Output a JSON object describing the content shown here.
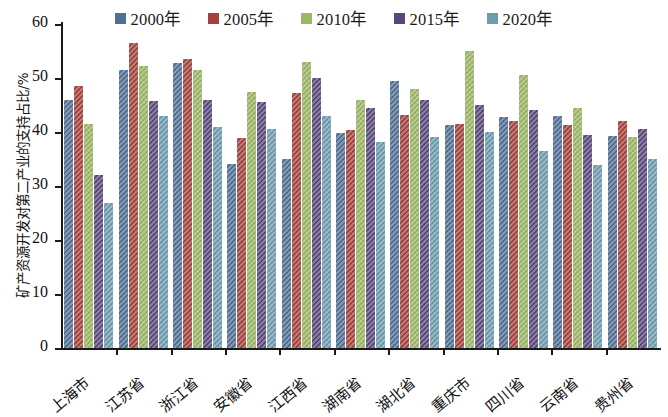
{
  "chart": {
    "type": "bar",
    "title": "",
    "ylabel": "矿产资源开发对第二产业的支持占比/%",
    "xlabel": ""
  },
  "legend": {
    "position": "top-center",
    "items": [
      {
        "label": "2000年",
        "color": "#4f6f96"
      },
      {
        "label": "2005年",
        "color": "#a5413a"
      },
      {
        "label": "2010年",
        "color": "#9cb863"
      },
      {
        "label": "2015年",
        "color": "#58477a"
      },
      {
        "label": "2020年",
        "color": "#6d9cb0"
      }
    ]
  },
  "axes": {
    "y_ticks": [
      "60",
      "50",
      "40",
      "30",
      "20",
      "10",
      "0"
    ],
    "y_min": 0,
    "y_max": 60,
    "y_step": 10
  },
  "chart_data": {
    "type": "bar",
    "title": "",
    "xlabel": "",
    "ylabel": "矿产资源开发对第二产业的支持占比/%",
    "ylim": [
      0,
      60
    ],
    "ytick_step": 10,
    "grid": false,
    "legend_position": "top-center",
    "categories": [
      "上海市",
      "江苏省",
      "浙江省",
      "安徽省",
      "江西省",
      "湖南省",
      "湖北省",
      "重庆市",
      "四川省",
      "云南省",
      "贵州省"
    ],
    "series": [
      {
        "name": "2000年",
        "color": "#4f6f96",
        "values": [
          46.0,
          51.5,
          52.8,
          34.0,
          35.0,
          39.8,
          49.5,
          41.3,
          42.8,
          43.0,
          39.3
        ]
      },
      {
        "name": "2005年",
        "color": "#a5413a",
        "values": [
          48.5,
          56.5,
          53.5,
          38.8,
          47.3,
          40.3,
          43.2,
          41.5,
          42.0,
          41.3,
          42.0
        ]
      },
      {
        "name": "2010年",
        "color": "#9cb863",
        "values": [
          41.5,
          52.3,
          51.5,
          47.5,
          53.0,
          46.0,
          48.0,
          55.0,
          50.5,
          44.5,
          39.0
        ]
      },
      {
        "name": "2015年",
        "color": "#58477a",
        "values": [
          32.0,
          45.8,
          46.0,
          45.5,
          50.0,
          44.5,
          46.0,
          45.0,
          44.0,
          39.5,
          40.5
        ]
      },
      {
        "name": "2020年",
        "color": "#6d9cb0",
        "values": [
          26.8,
          43.0,
          41.0,
          40.5,
          43.0,
          38.2,
          39.0,
          40.0,
          36.5,
          33.8,
          35.0
        ]
      }
    ]
  }
}
